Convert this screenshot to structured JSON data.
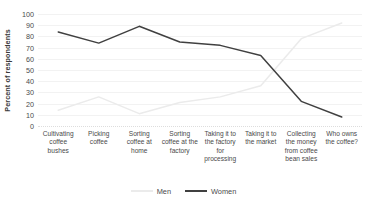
{
  "chart_data": {
    "type": "line",
    "title": "",
    "xlabel": "",
    "ylabel": "Percent of respondents",
    "ylim": [
      0,
      100
    ],
    "yticks": [
      0,
      10,
      20,
      30,
      40,
      50,
      60,
      70,
      80,
      90,
      100
    ],
    "grid": true,
    "legend_position": "bottom-center",
    "categories": [
      "Cultivating coffee bushes",
      "Picking coffee",
      "Sorting coffee at home",
      "Sorting coffee at the factory",
      "Taking it to the factory for processing",
      "Taking it to the market",
      "Collecting the money from coffee bean sales",
      "Who owns the coffee?"
    ],
    "series": [
      {
        "name": "Men",
        "color": "#ebebeb",
        "values": [
          14,
          26,
          11,
          21,
          26,
          36,
          78,
          92
        ]
      },
      {
        "name": "Women",
        "color": "#404040",
        "values": [
          84,
          74,
          89,
          75,
          72,
          63,
          22,
          8
        ]
      }
    ]
  }
}
